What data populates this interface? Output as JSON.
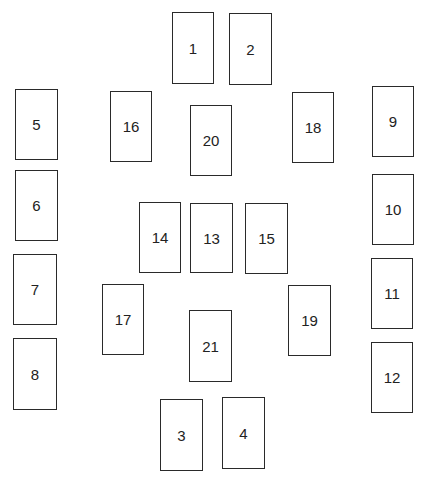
{
  "diagram": {
    "type": "fuse-box-layout",
    "boxes": [
      {
        "label": "1",
        "x": 172,
        "y": 12,
        "w": 42,
        "h": 72
      },
      {
        "label": "2",
        "x": 229,
        "y": 13,
        "w": 43,
        "h": 72
      },
      {
        "label": "5",
        "x": 15,
        "y": 89,
        "w": 43,
        "h": 71
      },
      {
        "label": "16",
        "x": 110,
        "y": 91,
        "w": 42,
        "h": 71
      },
      {
        "label": "20",
        "x": 190,
        "y": 105,
        "w": 42,
        "h": 71
      },
      {
        "label": "18",
        "x": 292,
        "y": 92,
        "w": 42,
        "h": 71
      },
      {
        "label": "9",
        "x": 372,
        "y": 86,
        "w": 42,
        "h": 71
      },
      {
        "label": "6",
        "x": 15,
        "y": 170,
        "w": 43,
        "h": 71
      },
      {
        "label": "10",
        "x": 372,
        "y": 174,
        "w": 42,
        "h": 71
      },
      {
        "label": "14",
        "x": 139,
        "y": 202,
        "w": 42,
        "h": 71
      },
      {
        "label": "13",
        "x": 190,
        "y": 203,
        "w": 43,
        "h": 70
      },
      {
        "label": "15",
        "x": 245,
        "y": 203,
        "w": 43,
        "h": 71
      },
      {
        "label": "7",
        "x": 13,
        "y": 254,
        "w": 44,
        "h": 71
      },
      {
        "label": "11",
        "x": 371,
        "y": 258,
        "w": 42,
        "h": 71
      },
      {
        "label": "17",
        "x": 102,
        "y": 284,
        "w": 42,
        "h": 71
      },
      {
        "label": "19",
        "x": 288,
        "y": 285,
        "w": 43,
        "h": 71
      },
      {
        "label": "21",
        "x": 189,
        "y": 310,
        "w": 43,
        "h": 72
      },
      {
        "label": "8",
        "x": 13,
        "y": 338,
        "w": 44,
        "h": 72
      },
      {
        "label": "12",
        "x": 371,
        "y": 342,
        "w": 42,
        "h": 71
      },
      {
        "label": "3",
        "x": 160,
        "y": 399,
        "w": 43,
        "h": 72
      },
      {
        "label": "4",
        "x": 222,
        "y": 397,
        "w": 43,
        "h": 72
      }
    ],
    "colors": {
      "background": "#ffffff",
      "border": "#2a2a2a",
      "text": "#222222"
    }
  }
}
